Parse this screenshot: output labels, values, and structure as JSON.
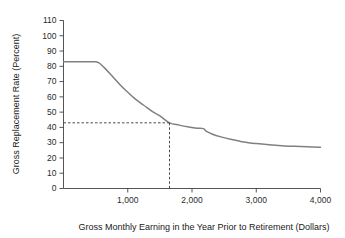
{
  "chart_data": {
    "type": "line",
    "title": "",
    "xlabel": "Gross Monthly Earning in the Year Prior to Retirement (Dollars)",
    "ylabel": "Gross Replacement Rate (Percent)",
    "xlim": [
      0,
      4000
    ],
    "ylim": [
      0,
      110
    ],
    "grid": false,
    "legend": null,
    "x_ticks": [
      1000,
      2000,
      3000,
      4000
    ],
    "x_tick_labels": [
      "1,000",
      "2,000",
      "3,000",
      "4,000"
    ],
    "y_ticks": [
      0,
      10,
      20,
      30,
      40,
      50,
      60,
      70,
      80,
      90,
      100,
      110
    ],
    "y_tick_labels": [
      "0",
      "10",
      "20",
      "30",
      "40",
      "50",
      "60",
      "70",
      "80",
      "90",
      "100",
      "110"
    ],
    "series": [
      {
        "name": "Gross replacement rate",
        "color": "#808080",
        "x": [
          0,
          200,
          400,
          500,
          560,
          650,
          760,
          880,
          1000,
          1120,
          1250,
          1380,
          1500,
          1650,
          1800,
          1950,
          2080,
          2180,
          2220,
          2320,
          2450,
          2600,
          2800,
          3000,
          3200,
          3400,
          3600,
          3800,
          4000
        ],
        "y": [
          83,
          83,
          83,
          83,
          82,
          78.5,
          73.5,
          68,
          63,
          58.5,
          54.5,
          50.5,
          47.5,
          43,
          41.5,
          40.3,
          39.5,
          39.2,
          37.5,
          35.5,
          33.8,
          32.2,
          30.5,
          29.4,
          28.6,
          28.0,
          27.6,
          27.3,
          27.0
        ]
      }
    ],
    "annotations": [
      {
        "kind": "guide-lines",
        "style": "dashed",
        "color": "#4a4a4a",
        "x_value": 1650,
        "y_value": 43,
        "description": "Dashed guide lines from the y-axis at 43 percent to the curve and down to about 1,650 dollars on the x-axis"
      }
    ]
  }
}
